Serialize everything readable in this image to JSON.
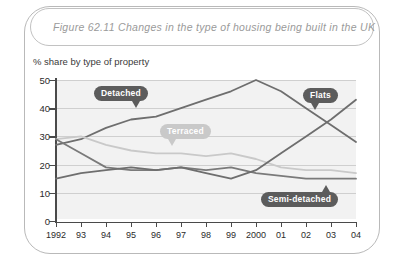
{
  "figure": {
    "title": "Figure 62.11   Changes in the type of housing being built in the UK",
    "subtitle": "% share by type of property"
  },
  "chart_data": {
    "type": "line",
    "title": "Changes in the type of housing being built in the UK",
    "subtitle": "% share by type of property",
    "xlabel": "",
    "ylabel": "% share by type of property",
    "categories": [
      "1992",
      "93",
      "94",
      "95",
      "96",
      "97",
      "98",
      "99",
      "2000",
      "01",
      "02",
      "03",
      "04"
    ],
    "x_tick_labels": [
      "1992",
      "93",
      "94",
      "95",
      "96",
      "97",
      "98",
      "99",
      "2000",
      "01",
      "02",
      "03",
      "04"
    ],
    "y_tick_labels": [
      "0",
      "10",
      "20",
      "30",
      "40",
      "50"
    ],
    "ylim": [
      0,
      50
    ],
    "y_ticks": [
      0,
      10,
      20,
      30,
      40,
      50
    ],
    "grid": true,
    "legend": "inline-callout-bubbles",
    "series": [
      {
        "name": "Detached",
        "color": "#6e6e6e",
        "label_style": "dark",
        "values": [
          27,
          29,
          33,
          36,
          37,
          40,
          43,
          46,
          50,
          46,
          40,
          34,
          28
        ]
      },
      {
        "name": "Terraced",
        "color": "#c9c9c9",
        "label_style": "light",
        "values": [
          29,
          30,
          27,
          25,
          24,
          24,
          23,
          24,
          22,
          19,
          18,
          18,
          17
        ]
      },
      {
        "name": "Semi-detached",
        "color": "#7a7a7a",
        "label_style": "dark",
        "values": [
          29,
          24,
          19,
          18,
          18,
          19,
          18,
          19,
          17,
          16,
          15,
          15,
          15
        ]
      },
      {
        "name": "Flats",
        "color": "#6e6e6e",
        "label_style": "dark",
        "values": [
          15,
          17,
          18,
          19,
          18,
          19,
          17,
          15,
          18,
          24,
          30,
          36,
          43
        ]
      }
    ],
    "annotations": [
      {
        "text": "Detached",
        "style": "dark"
      },
      {
        "text": "Terraced",
        "style": "light"
      },
      {
        "text": "Flats",
        "style": "dark"
      },
      {
        "text": "Semi-detached",
        "style": "dark"
      }
    ]
  }
}
